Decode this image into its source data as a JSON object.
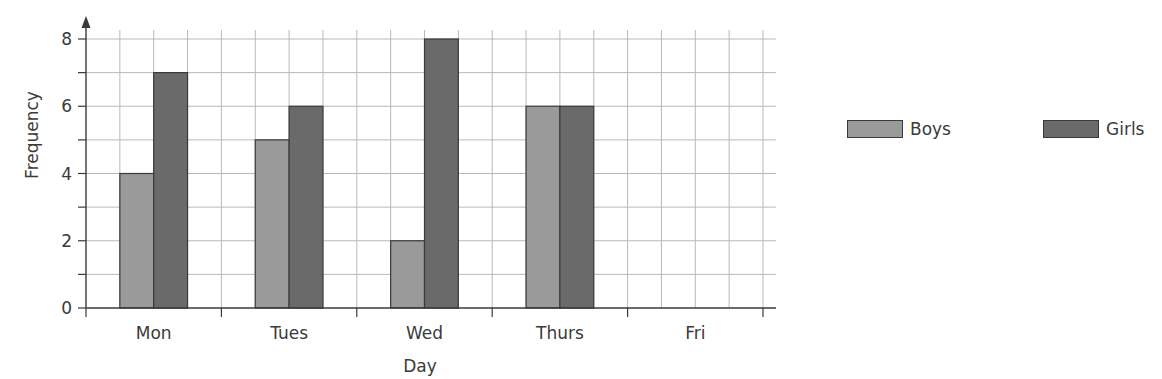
{
  "chart_data": {
    "type": "bar",
    "title": "",
    "xlabel": "Day",
    "ylabel": "Frequency",
    "categories": [
      "Mon",
      "Tues",
      "Wed",
      "Thurs",
      "Fri"
    ],
    "series": [
      {
        "name": "Boys",
        "color": "#9a9a9a",
        "values": [
          4,
          5,
          2,
          6,
          null
        ]
      },
      {
        "name": "Girls",
        "color": "#6a6a6a",
        "values": [
          7,
          6,
          8,
          6,
          null
        ]
      }
    ],
    "ylim": [
      0,
      8
    ],
    "yticks": [
      0,
      2,
      4,
      6,
      8
    ],
    "y_minor_step": 1,
    "grid": true,
    "legend_position": "right"
  },
  "legend": {
    "items": [
      {
        "label": "Boys",
        "color": "#9a9a9a"
      },
      {
        "label": "Girls",
        "color": "#6a6a6a"
      }
    ]
  },
  "axes": {
    "x_title": "Day",
    "y_title": "Frequency"
  }
}
